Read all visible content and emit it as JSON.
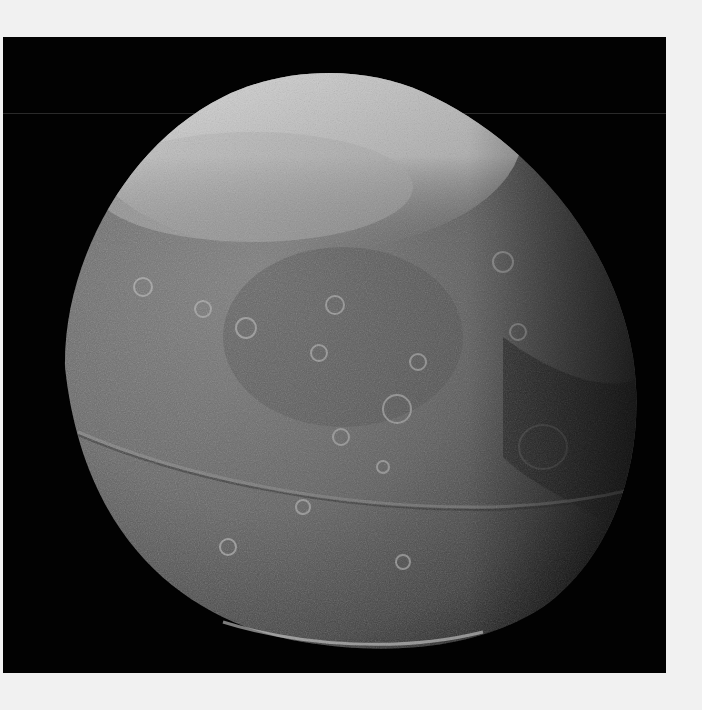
{
  "image": {
    "subject": "Cratered moon (Iapetus) against black space",
    "background_color": "#f1f1f1",
    "panel_color": "#020202",
    "colors": {
      "bright_cap": "#e6e6e6",
      "body_gray": "#6e6e6e",
      "dark_limb": "#2a2a2a",
      "ridge": "#8a8a8a"
    }
  }
}
